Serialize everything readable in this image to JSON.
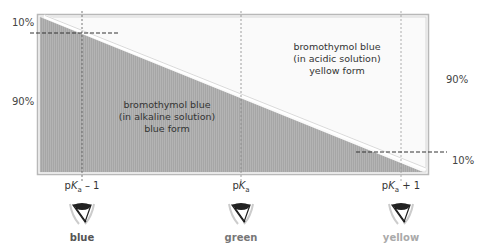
{
  "diagram": {
    "title": "",
    "regions": {
      "alkaline": {
        "line1": "bromothymol blue",
        "line2": "(in alkaline solution)",
        "line3": "blue form",
        "fill": "#a9a9a9"
      },
      "acidic": {
        "line1": "bromothymol blue",
        "line2": "(in acidic solution)",
        "line3": "yellow form",
        "fill": "#f4f4f4"
      }
    },
    "left_axis": {
      "top_label": "10%",
      "middle_label": "90%"
    },
    "right_axis": {
      "middle_label": "90%",
      "bottom_label": "10%"
    },
    "x_markers": [
      {
        "prefix": "p",
        "k": "K",
        "sub": "a",
        "suffix": " – 1",
        "color_name": "blue",
        "color": "#555555"
      },
      {
        "prefix": "p",
        "k": "K",
        "sub": "a",
        "suffix": "",
        "color_name": "green",
        "color": "#777777"
      },
      {
        "prefix": "p",
        "k": "K",
        "sub": "a",
        "suffix": " + 1",
        "color_name": "yellow",
        "color": "#aaaaaa"
      }
    ],
    "icons": [
      "eye-icon",
      "eye-icon",
      "eye-icon"
    ],
    "colors": {
      "frame": "#b8b8b8",
      "dashed": "#333333",
      "dotted_guides": "#888888"
    }
  }
}
